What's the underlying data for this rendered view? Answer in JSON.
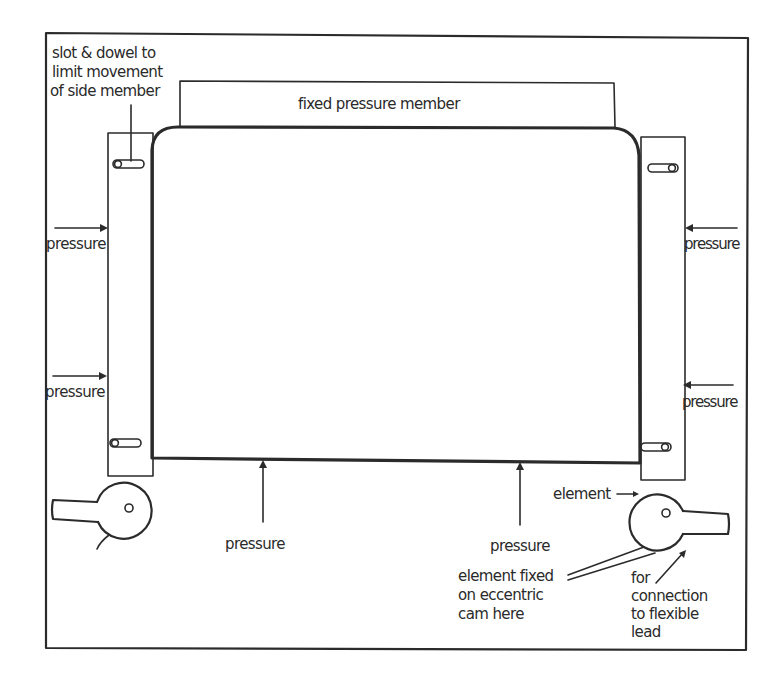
{
  "diagram": {
    "type": "mechanical-schematic",
    "colors": {
      "ink": "#2b2b2b",
      "background": "#ffffff"
    },
    "labels": {
      "slot_dowel_line1": "slot & dowel to",
      "slot_dowel_line2": "limit movement",
      "slot_dowel_line3": "of side member",
      "fixed_pressure_member": "fixed pressure member",
      "pressure_left_upper": "pressure",
      "pressure_left_lower": "pressure",
      "pressure_right_upper": "pressure",
      "pressure_right_lower": "pressure",
      "pressure_bottom_left": "pressure",
      "pressure_bottom_right": "pressure",
      "element": "element",
      "element_fixed_line1": "element fixed",
      "element_fixed_line2": "on eccentric",
      "element_fixed_line3": "cam here",
      "connection_line1": "for",
      "connection_line2": "connection",
      "connection_line3": "to flexible",
      "connection_line4": "lead"
    },
    "components": [
      {
        "name": "outer-frame"
      },
      {
        "name": "fixed-pressure-member"
      },
      {
        "name": "heating-element"
      },
      {
        "name": "left-side-member",
        "slots": 2
      },
      {
        "name": "right-side-member",
        "slots": 2
      },
      {
        "name": "left-eccentric-cam"
      },
      {
        "name": "right-eccentric-cam"
      }
    ]
  }
}
